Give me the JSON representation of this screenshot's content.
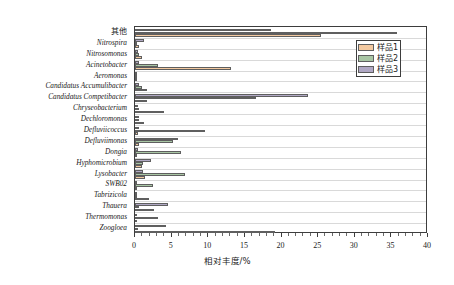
{
  "chart_data": {
    "type": "bar",
    "orientation": "horizontal",
    "title": "",
    "xlabel": "相对丰度/%",
    "ylabel": "",
    "xlim": [
      0,
      40
    ],
    "xticks": [
      0,
      5,
      10,
      15,
      20,
      25,
      30,
      35,
      40
    ],
    "xtick_labels": [
      "0",
      "5",
      "10",
      "15",
      "20",
      "25",
      "30",
      "35",
      "40"
    ],
    "grid": true,
    "legend_position": "top-right",
    "categories": [
      "其他",
      "Nitrospira",
      "Nitrosomonas",
      "Acinetobacter",
      "Aeromonas",
      "Candidatus Accumulibacter",
      "Candidatus Competibacter",
      "Chryseobacterium",
      "Dechloromonas",
      "Defluviicoccus",
      "Defluviimonas",
      "Dongia",
      "Hyphomicrobium",
      "Lysobacter",
      "SWB02",
      "Tabrizicola",
      "Thauera",
      "Thermomonas",
      "Zoogloea"
    ],
    "series": [
      {
        "name": "样品1",
        "color": "#f3c9a0",
        "values": [
          25.4,
          0.5,
          0.9,
          13.1,
          0.2,
          1.6,
          1.6,
          4.0,
          1.2,
          0.4,
          0.6,
          0.3,
          1.0,
          1.4,
          0.2,
          1.9,
          2.6,
          0.3,
          19.1
        ]
      },
      {
        "name": "样品2",
        "color": "#a8c6a4",
        "values": [
          35.7,
          0.3,
          0.5,
          3.2,
          0.3,
          1.0,
          16.5,
          0.5,
          0.6,
          9.5,
          5.2,
          6.3,
          1.1,
          6.8,
          2.4,
          0.2,
          0.5,
          3.2,
          0.4
        ]
      },
      {
        "name": "样品3",
        "color": "#b0a8c4",
        "values": [
          18.6,
          1.2,
          0.4,
          0.6,
          0.3,
          0.6,
          23.6,
          0.4,
          0.5,
          0.5,
          5.9,
          0.4,
          2.2,
          1.1,
          0.3,
          0.3,
          4.5,
          0.3,
          4.3
        ]
      }
    ]
  },
  "legend": {
    "items": [
      {
        "label": "样品1",
        "color": "#f3c9a0"
      },
      {
        "label": "样品2",
        "color": "#a8c6a4"
      },
      {
        "label": "样品3",
        "color": "#b0a8c4"
      }
    ]
  }
}
